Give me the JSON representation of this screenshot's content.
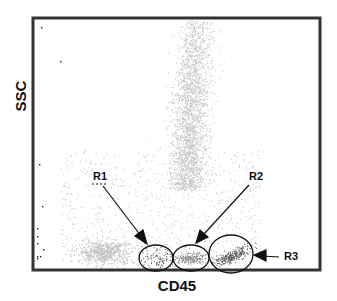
{
  "chart_data": {
    "type": "scatter",
    "title": "",
    "xlabel": "CD45",
    "ylabel": "SSC",
    "grid": false,
    "legend": null,
    "axis_ticks": "none shown",
    "populations": [
      {
        "name": "granulocytes-band",
        "description": "dense vertical band of high-SSC events at mid CD45",
        "x_center_frac": 0.55,
        "y_range_frac": [
          0.25,
          1.0
        ],
        "color": "#c8c8c8"
      },
      {
        "name": "low-CD45-low-SSC",
        "description": "low CD45, low SSC cluster",
        "x_center_frac": 0.25,
        "y_center_frac": 0.07,
        "color": "#c8c8c8"
      }
    ],
    "gates": [
      {
        "label": "R1",
        "shape": "ellipse",
        "cx_frac": 0.422,
        "cy_frac": 0.046,
        "rx_frac": 0.062,
        "ry_frac": 0.058
      },
      {
        "label": "R2",
        "shape": "ellipse",
        "cx_frac": 0.545,
        "cy_frac": 0.046,
        "rx_frac": 0.062,
        "ry_frac": 0.058
      },
      {
        "label": "R3",
        "shape": "ellipse",
        "cx_frac": 0.69,
        "cy_frac": 0.072,
        "rx_frac": 0.075,
        "ry_frac": 0.09
      }
    ],
    "annotations": [
      {
        "text": "R1",
        "arrow_to": "R1 gate",
        "direction": "down-right"
      },
      {
        "text": "R2",
        "arrow_to": "R2 gate",
        "direction": "down-left"
      },
      {
        "text": "R3",
        "arrow_to": "R3 gate",
        "direction": "left"
      }
    ]
  },
  "labels": {
    "x_axis": "CD45",
    "y_axis": "SSC",
    "r1": "R1",
    "r2": "R2",
    "r3": "R3"
  },
  "colors": {
    "frame": "#333333",
    "dots_light": "#c4c4c4",
    "dots_mid": "#8a8a8a",
    "dots_dark": "#555555",
    "gate_line": "#111111"
  }
}
